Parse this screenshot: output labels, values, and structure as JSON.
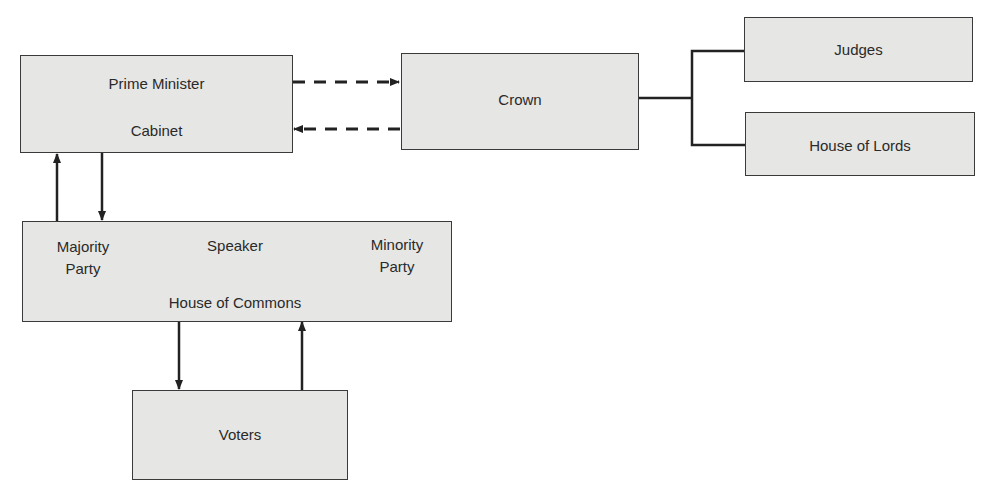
{
  "diagram": {
    "title": "",
    "colors": {
      "box_fill": "#e6e6e4",
      "border": "#3a3a3a",
      "line": "#222222",
      "text": "#2a2a2a"
    },
    "nodes": {
      "prime_minister_cabinet": {
        "line1": "Prime Minister",
        "line2": "Cabinet"
      },
      "crown": {
        "label": "Crown"
      },
      "judges": {
        "label": "Judges"
      },
      "house_of_lords": {
        "label": "House of Lords"
      },
      "house_of_commons": {
        "title": "House of Commons",
        "majority_line1": "Majority",
        "majority_line2": "Party",
        "speaker": "Speaker",
        "minority_line1": "Minority",
        "minority_line2": "Party"
      },
      "voters": {
        "label": "Voters"
      }
    },
    "edges": [
      {
        "from": "Prime Minister / Cabinet",
        "to": "Crown",
        "style": "dashed",
        "arrow": "to"
      },
      {
        "from": "Crown",
        "to": "Prime Minister / Cabinet",
        "style": "dashed",
        "arrow": "to"
      },
      {
        "from": "Crown",
        "to": "Judges",
        "style": "solid",
        "arrow": "none"
      },
      {
        "from": "Crown",
        "to": "House of Lords",
        "style": "solid",
        "arrow": "none"
      },
      {
        "from": "House of Commons (Majority Party)",
        "to": "Prime Minister / Cabinet",
        "style": "solid",
        "arrow": "to"
      },
      {
        "from": "Prime Minister / Cabinet",
        "to": "House of Commons (Majority Party)",
        "style": "solid",
        "arrow": "to"
      },
      {
        "from": "House of Commons",
        "to": "Voters",
        "style": "solid",
        "arrow": "to"
      },
      {
        "from": "Voters",
        "to": "House of Commons",
        "style": "solid",
        "arrow": "to"
      }
    ]
  }
}
